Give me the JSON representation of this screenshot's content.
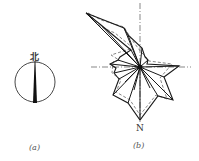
{
  "figure": {
    "panels": [
      {
        "id": "a",
        "caption": "(a)",
        "type": "north-arrow",
        "label": "北"
      },
      {
        "id": "b",
        "caption": "(b)",
        "type": "wind-rose",
        "direction_label": "N",
        "series": [
          {
            "name": "solid",
            "style": "solid"
          },
          {
            "name": "dashed",
            "style": "dashed"
          }
        ]
      }
    ]
  },
  "colors": {
    "line": "#1a1a1a",
    "dashed": "#666666",
    "background": "#ffffff"
  }
}
